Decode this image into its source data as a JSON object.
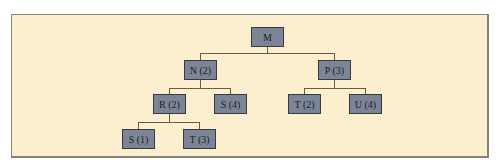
{
  "diagram": {
    "type": "tree",
    "nodes": {
      "root": {
        "label": "M"
      },
      "n": {
        "label": "N (2)"
      },
      "p": {
        "label": "P (3)"
      },
      "r": {
        "label": "R (2)"
      },
      "s4": {
        "label": "S (4)"
      },
      "t2": {
        "label": "T (2)"
      },
      "u": {
        "label": "U (4)"
      },
      "s1": {
        "label": "S (1)"
      },
      "t3": {
        "label": "T (3)"
      }
    },
    "edges": [
      [
        "M",
        "N (2)"
      ],
      [
        "M",
        "P (3)"
      ],
      [
        "N (2)",
        "R (2)"
      ],
      [
        "N (2)",
        "S (4)"
      ],
      [
        "P (3)",
        "T (2)"
      ],
      [
        "P (3)",
        "U (4)"
      ],
      [
        "R (2)",
        "S (1)"
      ],
      [
        "R (2)",
        "T (3)"
      ]
    ],
    "colors": {
      "background": "#fcefcf",
      "node_fill": "#7c8597",
      "connector": "#6e5a3e",
      "frame_border": "#8a8172"
    }
  }
}
